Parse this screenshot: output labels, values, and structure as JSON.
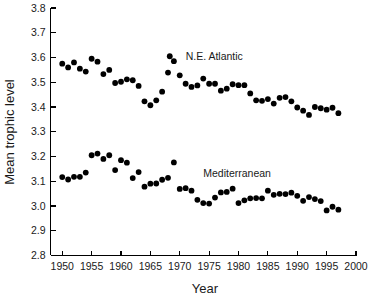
{
  "chart_data": {
    "type": "scatter",
    "title": "",
    "xlabel": "Year",
    "ylabel": "Mean trophic level",
    "xlim": [
      1948,
      2000
    ],
    "ylim": [
      2.8,
      3.8
    ],
    "xticks": [
      1950,
      1955,
      1960,
      1965,
      1970,
      1975,
      1980,
      1985,
      1990,
      1995,
      2000
    ],
    "yticks": [
      2.8,
      2.9,
      3.0,
      3.1,
      3.2,
      3.3,
      3.4,
      3.5,
      3.6,
      3.7,
      3.8
    ],
    "ytick_labels": [
      "2.8",
      "2.9",
      "3.0",
      "3.1",
      "3.2",
      "3.3",
      "3.4",
      "3.5",
      "3.6",
      "3.7",
      "3.8"
    ],
    "xtick_labels": [
      "1950",
      "1955",
      "1960",
      "1965",
      "1970",
      "1975",
      "1980",
      "1985",
      "1990",
      "1995",
      "2000"
    ],
    "grid": false,
    "legend_position": "inline-annotation",
    "marker": "filled-circle",
    "marker_color": "#000000",
    "series": [
      {
        "name": "N.E. Atlantic",
        "label_x": 1971.0,
        "label_y": 3.605,
        "marker_x": 1968.3,
        "marker_y": 3.605,
        "x": [
          1950,
          1951,
          1952,
          1953,
          1954,
          1955,
          1956,
          1957,
          1958,
          1959,
          1960,
          1961,
          1962,
          1963,
          1964,
          1965,
          1966,
          1967,
          1968,
          1969,
          1970,
          1971,
          1972,
          1973,
          1974,
          1975,
          1976,
          1977,
          1978,
          1979,
          1980,
          1981,
          1982,
          1983,
          1984,
          1985,
          1986,
          1987,
          1988,
          1989,
          1990,
          1991,
          1992,
          1993,
          1994,
          1995,
          1996,
          1997
        ],
        "y": [
          3.575,
          3.56,
          3.58,
          3.555,
          3.543,
          3.595,
          3.583,
          3.533,
          3.55,
          3.497,
          3.502,
          3.512,
          3.508,
          3.485,
          3.423,
          3.407,
          3.427,
          3.462,
          3.539,
          3.585,
          3.528,
          3.494,
          3.481,
          3.487,
          3.515,
          3.494,
          3.494,
          3.466,
          3.474,
          3.492,
          3.488,
          3.488,
          3.455,
          3.427,
          3.425,
          3.432,
          3.414,
          3.437,
          3.44,
          3.423,
          3.398,
          3.385,
          3.368,
          3.4,
          3.395,
          3.389,
          3.397,
          3.375
        ]
      },
      {
        "name": "Mediterranean",
        "label_x": 1974.0,
        "label_y": 3.133,
        "x": [
          1950,
          1951,
          1952,
          1953,
          1954,
          1955,
          1956,
          1957,
          1958,
          1959,
          1960,
          1961,
          1962,
          1963,
          1964,
          1965,
          1966,
          1967,
          1968,
          1969,
          1970,
          1971,
          1972,
          1973,
          1974,
          1975,
          1976,
          1977,
          1978,
          1979,
          1980,
          1981,
          1982,
          1983,
          1984,
          1985,
          1986,
          1987,
          1988,
          1989,
          1990,
          1991,
          1992,
          1993,
          1994,
          1995,
          1996,
          1997
        ],
        "y": [
          3.117,
          3.107,
          3.118,
          3.118,
          3.135,
          3.205,
          3.212,
          3.19,
          3.205,
          3.145,
          3.185,
          3.175,
          3.113,
          3.137,
          3.078,
          3.09,
          3.091,
          3.106,
          3.114,
          3.176,
          3.069,
          3.072,
          3.062,
          3.025,
          3.012,
          3.01,
          3.034,
          3.055,
          3.057,
          3.07,
          3.012,
          3.023,
          3.031,
          3.032,
          3.031,
          3.062,
          3.045,
          3.049,
          3.048,
          3.054,
          3.041,
          3.021,
          3.036,
          3.028,
          3.02,
          2.982,
          2.997,
          2.985
        ]
      }
    ]
  },
  "figure": {
    "background_color": "#ffffff",
    "axis_color": "#000000",
    "text_color": "#1a1a1a"
  }
}
